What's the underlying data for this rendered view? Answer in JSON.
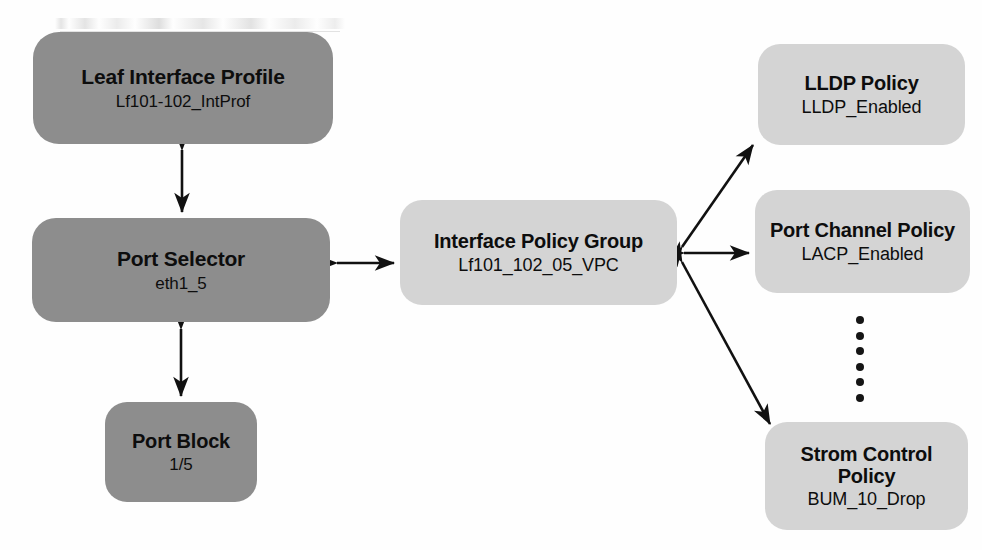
{
  "diagram": {
    "nodes": [
      {
        "id": "leaf-interface-profile",
        "title": "Leaf Interface Profile",
        "subtitle": "Lf101-102_IntProf",
        "style": "dark",
        "fill": "#8d8d8d"
      },
      {
        "id": "port-selector",
        "title": "Port Selector",
        "subtitle": "eth1_5",
        "style": "dark",
        "fill": "#8d8d8d"
      },
      {
        "id": "port-block",
        "title": "Port Block",
        "subtitle": "1/5",
        "style": "dark",
        "fill": "#8d8d8d"
      },
      {
        "id": "interface-policy-group",
        "title": "Interface Policy Group",
        "subtitle": "Lf101_102_05_VPC",
        "style": "light",
        "fill": "#d4d4d4"
      },
      {
        "id": "lldp-policy",
        "title": "LLDP Policy",
        "subtitle": "LLDP_Enabled",
        "style": "light",
        "fill": "#d4d4d4"
      },
      {
        "id": "port-channel-policy",
        "title": "Port Channel Policy",
        "subtitle": "LACP_Enabled",
        "style": "light",
        "fill": "#d4d4d4"
      },
      {
        "id": "storm-control-policy",
        "title": "Strom Control Policy",
        "subtitle": "BUM_10_Drop",
        "style": "light",
        "fill": "#d4d4d4"
      }
    ],
    "connectors": [
      {
        "id": "leaf-profile-to-port-selector",
        "from": "leaf-interface-profile",
        "to": "port-selector",
        "arrowheads": "both",
        "orientation": "vertical"
      },
      {
        "id": "port-selector-to-port-block",
        "from": "port-selector",
        "to": "port-block",
        "arrowheads": "both",
        "orientation": "vertical"
      },
      {
        "id": "port-selector-to-policy-group",
        "from": "port-selector",
        "to": "interface-policy-group",
        "arrowheads": "both",
        "orientation": "horizontal"
      },
      {
        "id": "policy-group-to-lldp",
        "from": "interface-policy-group",
        "to": "lldp-policy",
        "arrowheads": "both",
        "orientation": "diagonal-up"
      },
      {
        "id": "policy-group-to-port-channel",
        "from": "interface-policy-group",
        "to": "port-channel-policy",
        "arrowheads": "both",
        "orientation": "horizontal"
      },
      {
        "id": "policy-group-to-storm-control",
        "from": "interface-policy-group",
        "to": "storm-control-policy",
        "arrowheads": "both",
        "orientation": "diagonal-down"
      }
    ],
    "ellipsis": {
      "label": "additional policies",
      "dot_count": 6,
      "color": "#151515"
    },
    "line_color": "#111111",
    "text_color": "#0d0d0d",
    "background": "#ffffff"
  }
}
